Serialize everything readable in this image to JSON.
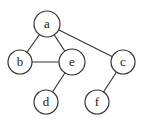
{
  "diagram": {
    "type": "undirected-graph",
    "nodes": [
      {
        "id": "a",
        "label": "a",
        "x": 47,
        "y": 24,
        "r": 13
      },
      {
        "id": "b",
        "label": "b",
        "x": 20,
        "y": 62,
        "r": 12
      },
      {
        "id": "e",
        "label": "e",
        "x": 72,
        "y": 62,
        "r": 13
      },
      {
        "id": "c",
        "label": "c",
        "x": 123,
        "y": 62,
        "r": 12
      },
      {
        "id": "d",
        "label": "d",
        "x": 46,
        "y": 102,
        "r": 12
      },
      {
        "id": "f",
        "label": "f",
        "x": 97,
        "y": 102,
        "r": 12
      }
    ],
    "edges": [
      {
        "from": "a",
        "to": "b"
      },
      {
        "from": "a",
        "to": "e"
      },
      {
        "from": "a",
        "to": "c"
      },
      {
        "from": "b",
        "to": "e"
      },
      {
        "from": "e",
        "to": "d"
      },
      {
        "from": "c",
        "to": "f"
      }
    ],
    "colors": {
      "stroke": "#333333",
      "fill": "#ffffff",
      "text": "#222222"
    }
  }
}
